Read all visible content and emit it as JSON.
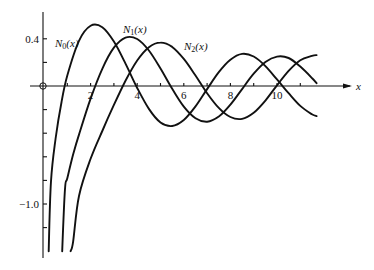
{
  "chart_data": {
    "type": "line",
    "title": "",
    "xlabel": "x",
    "ylabel": "",
    "xlim": [
      0,
      12
    ],
    "ylim": [
      -1.4,
      0.6
    ],
    "grid": false,
    "x_ticks": [
      2,
      4,
      6,
      8,
      10
    ],
    "x_minor_ticks": [
      1,
      3,
      5,
      7,
      9,
      11
    ],
    "y_ticks": [
      0.4,
      -1.0
    ],
    "y_minor_ticks": [
      0.2,
      -0.2,
      -0.4,
      -0.6,
      -0.8,
      -1.2
    ],
    "x_tick_labels": [
      "2",
      "4",
      "6",
      "8",
      "10"
    ],
    "y_tick_labels": [
      "0.4",
      "−1.0"
    ],
    "series": [
      {
        "name": "N0(x)",
        "label_main": "N",
        "label_sub": "0",
        "label_tail": "(x)",
        "x": [
          0.3,
          0.5,
          0.75,
          1,
          1.5,
          2,
          2.5,
          3,
          3.5,
          4,
          4.5,
          5,
          5.5,
          6,
          6.5,
          7,
          7.5,
          8,
          8.5,
          9,
          9.5,
          10,
          10.5,
          11,
          11.5,
          11.7
        ],
        "y": [
          -0.807,
          -0.445,
          -0.137,
          0.088,
          0.382,
          0.51,
          0.498,
          0.377,
          0.189,
          -0.017,
          -0.194,
          -0.309,
          -0.339,
          -0.288,
          -0.173,
          -0.026,
          0.117,
          0.223,
          0.272,
          0.25,
          0.169,
          0.056,
          -0.061,
          -0.169,
          -0.24,
          -0.255
        ]
      },
      {
        "name": "N1(x)",
        "label_main": "N",
        "label_sub": "1",
        "label_tail": "(x)",
        "x": [
          0.9,
          1,
          1.25,
          1.5,
          2,
          2.5,
          3,
          3.5,
          4,
          4.5,
          5,
          5.5,
          6,
          6.5,
          7,
          7.5,
          8,
          8.5,
          9,
          9.5,
          10,
          10.5,
          11,
          11.5,
          11.7
        ],
        "y": [
          -0.873,
          -0.781,
          -0.581,
          -0.412,
          -0.107,
          0.146,
          0.325,
          0.41,
          0.398,
          0.301,
          0.148,
          -0.024,
          -0.175,
          -0.274,
          -0.303,
          -0.259,
          -0.158,
          -0.026,
          0.104,
          0.203,
          0.249,
          0.237,
          0.164,
          0.068,
          0.024
        ]
      },
      {
        "name": "N2(x)",
        "label_main": "N",
        "label_sub": "2",
        "label_tail": "(x)",
        "x": [
          1.25,
          1.5,
          2,
          2.5,
          3,
          3.5,
          4,
          4.5,
          5,
          5.5,
          6,
          6.5,
          7,
          7.5,
          8,
          8.5,
          9,
          9.5,
          10,
          10.5,
          11,
          11.5,
          11.7
        ],
        "y": [
          -1.32,
          -0.932,
          -0.617,
          -0.381,
          -0.16,
          0.045,
          0.216,
          0.329,
          0.368,
          0.331,
          0.23,
          0.089,
          -0.061,
          -0.186,
          -0.263,
          -0.279,
          -0.227,
          -0.124,
          0.006,
          0.128,
          0.219,
          0.255,
          0.262
        ]
      }
    ],
    "annotations": [
      "N0(x)",
      "N1(x)",
      "N2(x)"
    ],
    "legend": "inline labels near curve peaks"
  },
  "axis": {
    "x_label": "x",
    "origin_marker": "circle"
  }
}
